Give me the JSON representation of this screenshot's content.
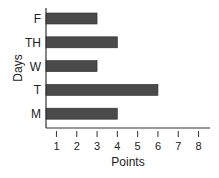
{
  "chart_data": {
    "type": "bar",
    "orientation": "horizontal",
    "title": "",
    "xlabel": "Points",
    "ylabel": "Days",
    "categories": [
      "F",
      "TH",
      "W",
      "T",
      "M"
    ],
    "values": [
      3,
      4,
      3,
      6,
      4
    ],
    "xlim": [
      0.5,
      8.5
    ],
    "x_ticks": [
      1,
      2,
      3,
      4,
      5,
      6,
      7,
      8
    ],
    "grid": false,
    "legend": null,
    "bar_color": "#4a4a4a"
  }
}
